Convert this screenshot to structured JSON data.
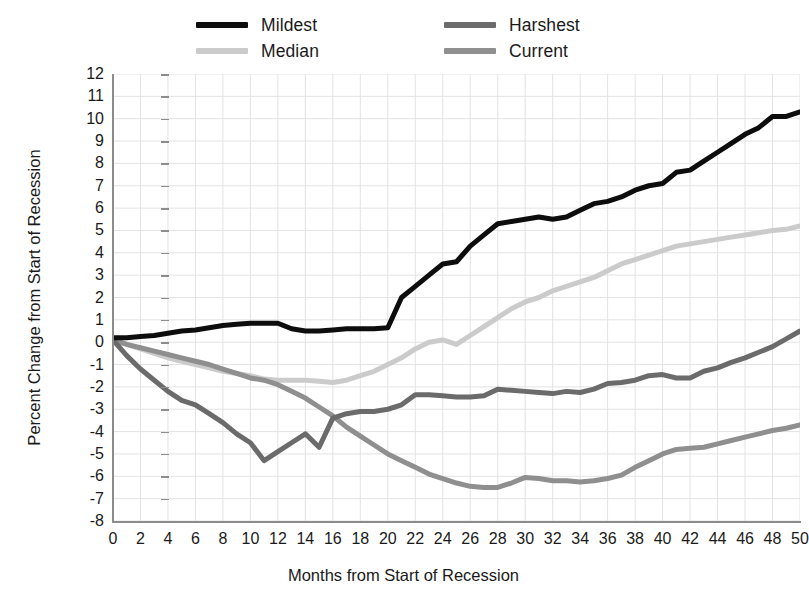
{
  "chart_data": {
    "type": "line",
    "title": "",
    "xlabel": "Months from Start of Recession",
    "ylabel": "Percent Change from Start of Recession",
    "xlim": [
      0,
      50
    ],
    "ylim": [
      -8,
      12
    ],
    "x_ticks": [
      0,
      2,
      4,
      6,
      8,
      10,
      12,
      14,
      16,
      18,
      20,
      22,
      24,
      26,
      28,
      30,
      32,
      34,
      36,
      38,
      40,
      42,
      44,
      46,
      48,
      50
    ],
    "y_ticks": [
      -8,
      -7,
      -6,
      -5,
      -4,
      -3,
      -2,
      -1,
      0,
      1,
      2,
      3,
      4,
      5,
      6,
      7,
      8,
      9,
      10,
      11,
      12
    ],
    "grid": true,
    "legend_position": "top",
    "x": [
      0,
      1,
      2,
      3,
      4,
      5,
      6,
      7,
      8,
      9,
      10,
      11,
      12,
      13,
      14,
      15,
      16,
      17,
      18,
      19,
      20,
      21,
      22,
      23,
      24,
      25,
      26,
      27,
      28,
      29,
      30,
      31,
      32,
      33,
      34,
      35,
      36,
      37,
      38,
      39,
      40,
      41,
      42,
      43,
      44,
      45,
      46,
      47,
      48,
      49,
      50
    ],
    "series": [
      {
        "name": "Mildest",
        "color": "#0d0d0d",
        "width": 5.0,
        "values": [
          0.2,
          0.2,
          0.25,
          0.3,
          0.4,
          0.5,
          0.55,
          0.65,
          0.75,
          0.8,
          0.85,
          0.85,
          0.85,
          0.6,
          0.5,
          0.5,
          0.55,
          0.6,
          0.6,
          0.6,
          0.65,
          2.0,
          2.5,
          3.0,
          3.5,
          3.6,
          4.3,
          4.8,
          5.3,
          5.4,
          5.5,
          5.6,
          5.5,
          5.6,
          5.9,
          6.2,
          6.3,
          6.5,
          6.8,
          7.0,
          7.1,
          7.6,
          7.7,
          8.1,
          8.5,
          8.9,
          9.3,
          9.6,
          10.1,
          10.1,
          10.3
        ]
      },
      {
        "name": "Median",
        "color": "#cbcbcb",
        "width": 5.0,
        "values": [
          0.1,
          -0.1,
          -0.3,
          -0.5,
          -0.7,
          -0.85,
          -1.0,
          -1.15,
          -1.3,
          -1.4,
          -1.5,
          -1.65,
          -1.7,
          -1.7,
          -1.7,
          -1.75,
          -1.8,
          -1.7,
          -1.5,
          -1.3,
          -1.0,
          -0.7,
          -0.3,
          0.0,
          0.1,
          -0.1,
          0.3,
          0.7,
          1.1,
          1.5,
          1.8,
          2.0,
          2.3,
          2.5,
          2.7,
          2.9,
          3.2,
          3.5,
          3.7,
          3.9,
          4.1,
          4.3,
          4.4,
          4.5,
          4.6,
          4.7,
          4.8,
          4.9,
          5.0,
          5.05,
          5.2
        ]
      },
      {
        "name": "Harshest",
        "color": "#6b6b6b",
        "width": 5.0,
        "values": [
          0.1,
          -0.6,
          -1.2,
          -1.7,
          -2.2,
          -2.6,
          -2.8,
          -3.2,
          -3.6,
          -4.1,
          -4.5,
          -5.3,
          -4.9,
          -4.5,
          -4.1,
          -4.7,
          -3.4,
          -3.2,
          -3.1,
          -3.1,
          -3.0,
          -2.8,
          -2.35,
          -2.35,
          -2.4,
          -2.45,
          -2.45,
          -2.4,
          -2.1,
          -2.15,
          -2.2,
          -2.25,
          -2.3,
          -2.2,
          -2.25,
          -2.1,
          -1.85,
          -1.8,
          -1.7,
          -1.5,
          -1.45,
          -1.6,
          -1.6,
          -1.3,
          -1.15,
          -0.9,
          -0.7,
          -0.45,
          -0.2,
          0.15,
          0.5
        ]
      },
      {
        "name": "Current",
        "color": "#8f8f8f",
        "width": 5.0,
        "values": [
          0.1,
          -0.1,
          -0.25,
          -0.4,
          -0.55,
          -0.7,
          -0.85,
          -1.0,
          -1.2,
          -1.4,
          -1.6,
          -1.7,
          -1.9,
          -2.2,
          -2.5,
          -2.9,
          -3.3,
          -3.8,
          -4.2,
          -4.6,
          -5.0,
          -5.3,
          -5.6,
          -5.9,
          -6.1,
          -6.3,
          -6.45,
          -6.5,
          -6.5,
          -6.3,
          -6.05,
          -6.1,
          -6.2,
          -6.2,
          -6.25,
          -6.2,
          -6.1,
          -5.95,
          -5.6,
          -5.3,
          -5.0,
          -4.8,
          -4.75,
          -4.7,
          -4.55,
          -4.4,
          -4.25,
          -4.1,
          -3.95,
          -3.85,
          -3.7
        ]
      }
    ]
  },
  "legend": {
    "entries": [
      {
        "label": "Mildest",
        "color": "#0d0d0d"
      },
      {
        "label": "Median",
        "color": "#cbcbcb"
      },
      {
        "label": "Harshest",
        "color": "#6b6b6b"
      },
      {
        "label": "Current",
        "color": "#8f8f8f"
      }
    ]
  },
  "axes": {
    "x_title": "Months from Start of Recession",
    "y_title": "Percent Change from Start of Recession"
  },
  "style": {
    "grid_color": "#e3e3e3",
    "axis_color": "#8c8c8c",
    "text_color": "#1a1a1a",
    "background": "#ffffff"
  }
}
